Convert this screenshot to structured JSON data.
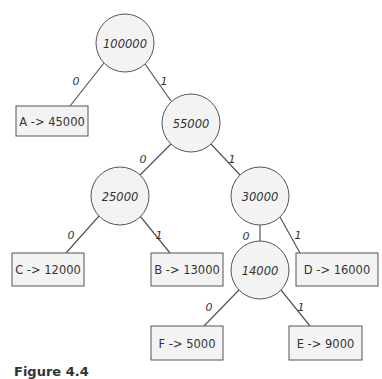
{
  "diagram": {
    "type": "huffman-tree",
    "colors": {
      "stroke": "#555555",
      "fill": "#f3f3f3",
      "text": "#333333"
    },
    "internal_nodes": [
      {
        "id": "n100000",
        "label": "100000",
        "cx": 125,
        "cy": 43
      },
      {
        "id": "n55000",
        "label": "55000",
        "cx": 191,
        "cy": 123
      },
      {
        "id": "n25000",
        "label": "25000",
        "cx": 120,
        "cy": 196
      },
      {
        "id": "n30000",
        "label": "30000",
        "cx": 260,
        "cy": 196
      },
      {
        "id": "n14000",
        "label": "14000",
        "cx": 260,
        "cy": 270
      }
    ],
    "leaves": [
      {
        "id": "A",
        "label": "A -> 45000",
        "x": 16,
        "y": 106,
        "w": 72,
        "h": 30
      },
      {
        "id": "C",
        "label": "C -> 12000",
        "x": 12,
        "y": 253,
        "w": 72,
        "h": 33
      },
      {
        "id": "B",
        "label": "B -> 13000",
        "x": 151,
        "y": 253,
        "w": 72,
        "h": 33
      },
      {
        "id": "D",
        "label": "D -> 16000",
        "x": 296,
        "y": 253,
        "w": 82,
        "h": 33
      },
      {
        "id": "F",
        "label": "F -> 5000",
        "x": 151,
        "y": 326,
        "w": 72,
        "h": 34
      },
      {
        "id": "E",
        "label": "E -> 9000",
        "x": 289,
        "y": 326,
        "w": 73,
        "h": 34
      }
    ],
    "edges": [
      {
        "from": "n100000",
        "to": "A",
        "label": "0",
        "x1": 104,
        "y1": 63,
        "x2": 70,
        "y2": 106,
        "lx": 76,
        "ly": 82
      },
      {
        "from": "n100000",
        "to": "n55000",
        "label": "1",
        "x1": 145,
        "y1": 64,
        "x2": 171,
        "y2": 101,
        "lx": 164,
        "ly": 82
      },
      {
        "from": "n55000",
        "to": "n25000",
        "label": "0",
        "x1": 171,
        "y1": 144,
        "x2": 140,
        "y2": 175,
        "lx": 143,
        "ly": 160
      },
      {
        "from": "n55000",
        "to": "n30000",
        "label": "1",
        "x1": 211,
        "y1": 144,
        "x2": 240,
        "y2": 175,
        "lx": 232,
        "ly": 160
      },
      {
        "from": "n25000",
        "to": "C",
        "label": "0",
        "x1": 99,
        "y1": 216,
        "x2": 66,
        "y2": 253,
        "lx": 71,
        "ly": 236
      },
      {
        "from": "n25000",
        "to": "B",
        "label": "1",
        "x1": 140,
        "y1": 216,
        "x2": 170,
        "y2": 253,
        "lx": 159,
        "ly": 236
      },
      {
        "from": "n30000",
        "to": "n14000",
        "label": "0",
        "x1": 260,
        "y1": 225,
        "x2": 260,
        "y2": 241,
        "lx": 246,
        "ly": 237
      },
      {
        "from": "n30000",
        "to": "D",
        "label": "1",
        "x1": 280,
        "y1": 217,
        "x2": 300,
        "y2": 253,
        "lx": 298,
        "ly": 236
      },
      {
        "from": "n14000",
        "to": "F",
        "label": "0",
        "x1": 239,
        "y1": 290,
        "x2": 204,
        "y2": 326,
        "lx": 209,
        "ly": 308
      },
      {
        "from": "n14000",
        "to": "E",
        "label": "1",
        "x1": 281,
        "y1": 290,
        "x2": 310,
        "y2": 326,
        "lx": 301,
        "ly": 308
      }
    ]
  },
  "caption": "Figure 4.4"
}
